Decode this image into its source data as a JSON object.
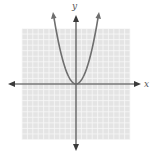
{
  "chart_data": {
    "type": "line",
    "title": "",
    "xlabel": "x",
    "ylabel": "y",
    "grid": true,
    "xlim": [
      -10,
      10
    ],
    "ylim": [
      -10,
      10
    ],
    "function": "y = x^2",
    "series": [
      {
        "name": "parabola",
        "x": [
          -3.5,
          -3,
          -2.5,
          -2,
          -1.5,
          -1,
          -0.5,
          0,
          0.5,
          1,
          1.5,
          2,
          2.5,
          3,
          3.5
        ],
        "values": [
          12.25,
          9,
          6.25,
          4,
          2.25,
          1,
          0.25,
          0,
          0.25,
          1,
          2.25,
          4,
          6.25,
          9,
          12.25
        ]
      }
    ],
    "vertex": [
      0,
      0
    ],
    "colors": {
      "curve": "#6e6e6e",
      "axes": "#3a3a3a",
      "grid_background": "#e4e4e4",
      "grid_lines": "#f7f7f7"
    }
  },
  "labels": {
    "x_axis": "x",
    "y_axis": "y"
  }
}
